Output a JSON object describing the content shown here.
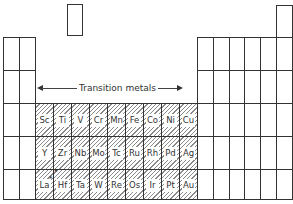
{
  "diagram": {
    "title_label": "Transition metals",
    "highlight_color": "#8a8a8a",
    "line_color": "#333333",
    "transition_metals": {
      "period4": [
        "Sc",
        "Ti",
        "V",
        "Cr",
        "Mn",
        "Fe",
        "Co",
        "Ni",
        "Cu"
      ],
      "period5": [
        "Y",
        "Zr",
        "Nb",
        "Mo",
        "Tc",
        "Ru",
        "Rh",
        "Pd",
        "Ag"
      ],
      "period6": [
        "La",
        "Hf",
        "Ta",
        "W",
        "Re",
        "Os",
        "Ir",
        "Pt",
        "Au"
      ]
    },
    "annotations": {
      "la_marker": "*"
    }
  }
}
